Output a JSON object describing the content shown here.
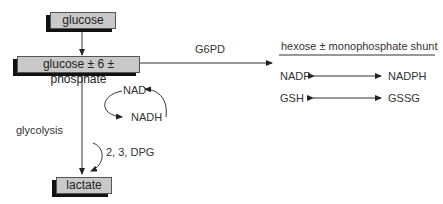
{
  "nodes": {
    "glucose": "glucose",
    "g6p": "glucose ± 6 ± phosphate",
    "lactate": "lactate"
  },
  "edges": {
    "g6pd": "G6PD",
    "glycolysis": "glycolysis",
    "dpg": "2, 3, DPG"
  },
  "cofactors": {
    "nad": "NAD",
    "nadh": "NADH"
  },
  "shunt": {
    "title": "hexose ± monophosphate shunt",
    "pairs": [
      {
        "left": "NADP",
        "right": "NADPH"
      },
      {
        "left": "GSH",
        "right": "GSSG"
      }
    ]
  }
}
